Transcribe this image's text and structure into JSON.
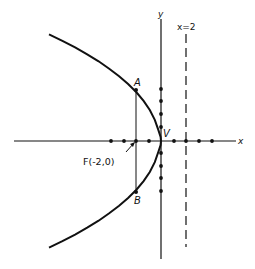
{
  "figure": {
    "equation": "y^2 = -8x",
    "colors": {
      "ink": "#111111",
      "background": "#ffffff"
    },
    "axes": {
      "x_label": "x",
      "y_label": "y",
      "x_tick_units": [
        -4,
        -3,
        -2,
        -1,
        0,
        1,
        2,
        3,
        4
      ],
      "y_tick_units": [
        -4,
        -3,
        -2,
        -1,
        1,
        2,
        3,
        4
      ]
    },
    "labels": {
      "vertex": "V",
      "point_a": "A",
      "point_b": "B",
      "focus": "F(-2,0)",
      "directrix": "x=2"
    },
    "points": {
      "vertex": [
        0,
        0
      ],
      "focus": [
        -2,
        0
      ],
      "A": [
        -2,
        4
      ],
      "B": [
        -2,
        -4
      ]
    },
    "directrix_x": 2
  }
}
